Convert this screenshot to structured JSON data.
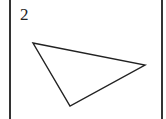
{
  "figure": {
    "label": "2",
    "shape": "triangle",
    "vertices": [
      [
        33,
        43
      ],
      [
        145,
        65
      ],
      [
        70,
        106
      ]
    ],
    "stroke_color": "#222222"
  }
}
